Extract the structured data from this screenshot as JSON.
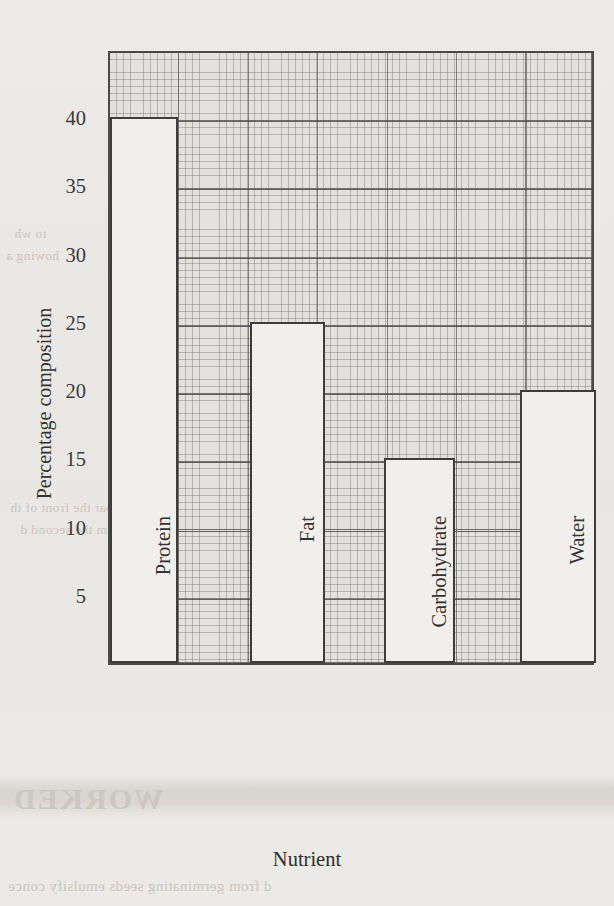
{
  "chart_data": {
    "type": "bar",
    "title": "",
    "xlabel": "Nutrient",
    "ylabel": "Percentage composition",
    "categories": [
      "Protein",
      "Fat",
      "Carbohydrate",
      "Water"
    ],
    "values": [
      40,
      25,
      15,
      20
    ],
    "ylim": [
      0,
      45
    ],
    "yticks": [
      5,
      10,
      15,
      20,
      25,
      30,
      35,
      40
    ],
    "ytick_labels": [
      "5",
      "10",
      "15",
      "20",
      "25",
      "30",
      "35",
      "40"
    ],
    "grid": "graph-paper minor and major squares",
    "legend": "none",
    "bar_style": {
      "fill": "#f1efeb",
      "edge": "#3d3d3d",
      "note": "unfilled outline bars drawn over squared graph paper"
    },
    "series": [
      {
        "name": "Percentage composition",
        "values": [
          40,
          25,
          15,
          20
        ]
      }
    ]
  },
  "axes": {
    "y": {
      "title": "Percentage composition",
      "ticks": [
        {
          "value": 40,
          "label": "40"
        },
        {
          "value": 35,
          "label": "35"
        },
        {
          "value": 30,
          "label": "30"
        },
        {
          "value": 25,
          "label": "25"
        },
        {
          "value": 20,
          "label": "20"
        },
        {
          "value": 15,
          "label": "15"
        },
        {
          "value": 10,
          "label": "10"
        },
        {
          "value": 5,
          "label": "5"
        }
      ]
    },
    "x": {
      "title": "Nutrient",
      "categories": [
        {
          "label": "Protein",
          "value": 40
        },
        {
          "label": "Fat",
          "value": 25
        },
        {
          "label": "Carbohydrate",
          "value": 15
        },
        {
          "label": "Water",
          "value": 20
        }
      ]
    }
  },
  "page": {
    "background_color": "#eceae6",
    "ink_color": "#3a3a3a",
    "grid_color": "#6e6e6e",
    "bleed_through": [
      "to wh",
      "howing a",
      "ale compar the front of th",
      "ards from the second d",
      "WORKED",
      "d from germinating seeds emulsify conce"
    ]
  }
}
